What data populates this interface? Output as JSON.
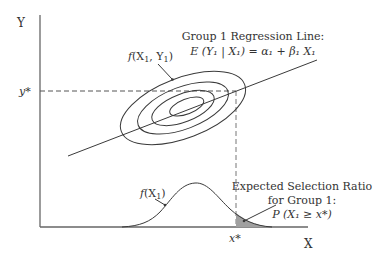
{
  "figure": {
    "axes": {
      "y_label": "Y",
      "x_label": "X",
      "y_star": "y*",
      "x_star": "x*"
    },
    "joint_density": {
      "label_f": "f",
      "label_args": "(X",
      "label_sub1": "1",
      "label_mid": ", Y",
      "label_sub2": "1",
      "label_close": ")"
    },
    "regression": {
      "title": "Group 1 Regression Line:",
      "equation": "E (Y₁ | X₁) = α₁ + β₁ X₁"
    },
    "marginal_density": {
      "label_f": "f",
      "label_args": "(X",
      "label_sub": "1",
      "label_close": ")"
    },
    "selection": {
      "line1": "Expected Selection Ratio",
      "line2": "for Group 1:",
      "line3": "P (X₁ ≥ x*)"
    },
    "colors": {
      "line": "#3a3a3a",
      "axis": "#555555",
      "shade": "#9a9a9a",
      "text": "#333333"
    }
  }
}
